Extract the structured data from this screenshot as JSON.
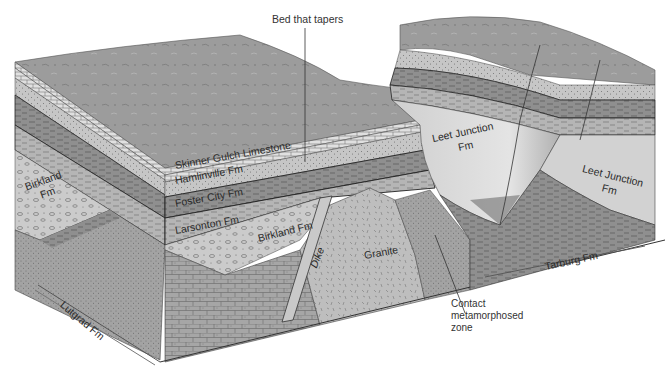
{
  "callouts": {
    "bed_that_tapers": "Bed that tapers",
    "contact_zone": [
      "Contact",
      "metamorphosed",
      "zone"
    ]
  },
  "formations": {
    "skinner_gulch": "Skinner Gulch Limestone",
    "hamlinville": "Hamlinville Fm",
    "foster_city": "Foster City Fm",
    "larsonton": "Larsonton Fm",
    "birkland_front": "Birkland Fm",
    "birkland_side": [
      "Birkland",
      "Fm"
    ],
    "granite": "Granite",
    "dike": "Dike",
    "leet_junction_valley": [
      "Leet Junction",
      "Fm"
    ],
    "leet_junction_right": [
      "Leet Junction",
      "Fm"
    ],
    "lutgrad": "Lutgrad Fm",
    "tarburg": "Tarburg Fm"
  },
  "colors": {
    "background": "#ffffff",
    "surface": "#9a9a9a",
    "limestone": "#d6d6d6",
    "sandstone": "#c4c4c4",
    "shale": "#8c8c8c",
    "conglomerate": "#c8c8c8",
    "granite": "#bdbdbd",
    "deep": "#a8a8a8",
    "line": "#2a2a2a"
  }
}
